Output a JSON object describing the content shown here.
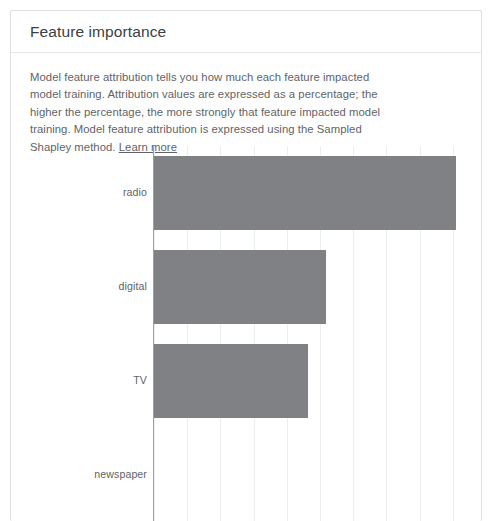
{
  "card": {
    "title": "Feature importance"
  },
  "description": {
    "body": "Model feature attribution tells you how much each feature impacted model training. Attribution values are expressed as a percentage; the higher the percentage, the more strongly that feature impacted model training. Model feature attribution is expressed using the Sampled Shapley method. ",
    "learn_more_label": "Learn more"
  },
  "colors": {
    "bar": "#7f8184",
    "gridline": "#eceef0",
    "axis": "#9aa0a6",
    "title_text": "#3c4043",
    "body_text": "#5f6368",
    "card_border": "#dcdfe3"
  },
  "chart_data": {
    "type": "bar",
    "orientation": "horizontal",
    "title": "Feature importance",
    "xlabel": "",
    "ylabel": "",
    "categories": [
      "radio",
      "digital",
      "TV",
      "newspaper"
    ],
    "values": [
      100,
      57,
      51,
      0
    ],
    "xlim": [
      0,
      110
    ],
    "gridlines_x": [
      0,
      11,
      22,
      33,
      44,
      55,
      66,
      77,
      88,
      99,
      110
    ],
    "grid": true,
    "legend": false,
    "tick_labels_x": [],
    "axis_visible": "y",
    "note": "Bar lengths read from pixel extents relative to the axis; values normalized so the longest bar (radio) is 100."
  }
}
